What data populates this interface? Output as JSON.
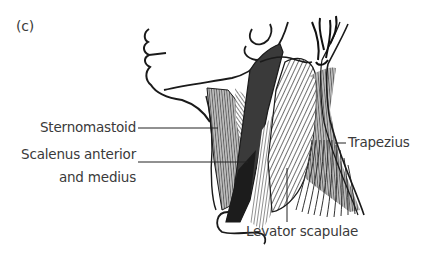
{
  "figure": {
    "panel_label": "(c)",
    "labels": {
      "sternomastoid": "Sternomastoid",
      "scalenus_line1": "Scalenus anterior",
      "scalenus_line2": "and medius",
      "trapezius": "Trapezius",
      "levator_scapulae": "Levator scapulae"
    },
    "colors": {
      "ink": "#1a1a1a",
      "text": "#3a3a3a",
      "dark_muscle": "#2a2a2a",
      "mid_muscle": "#6a6a6a",
      "light_hatch": "#8a8a8a",
      "background": "#ffffff"
    }
  }
}
